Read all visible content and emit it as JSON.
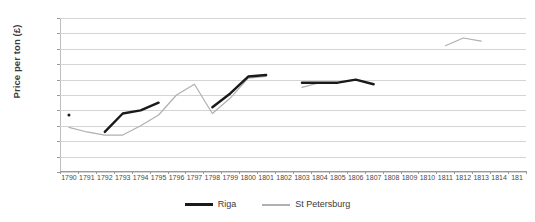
{
  "chart_data": {
    "type": "line",
    "title": "",
    "xlabel": "",
    "ylabel": "Price per ton (£)",
    "ylim": [
      0,
      100
    ],
    "ytick_step": 10,
    "yticks": [
      "0",
      "10",
      "20",
      "30",
      "40",
      "50",
      "60",
      "70",
      "80",
      "90",
      "100"
    ],
    "grid": true,
    "legend_position": "bottom",
    "categories": [
      "1790",
      "1791",
      "1792",
      "1793",
      "1794",
      "1795",
      "1796",
      "1797",
      "1798",
      "1799",
      "1800",
      "1801",
      "1802",
      "1803",
      "1804",
      "1805",
      "1806",
      "1807",
      "1808",
      "1809",
      "1810",
      "1811",
      "1812",
      "1813",
      "1814",
      "181"
    ],
    "last_tick_truncated": true,
    "series": [
      {
        "name": "Riga",
        "color": "#1a1a1a",
        "values": [
          37,
          null,
          26,
          38,
          40,
          45,
          null,
          null,
          42,
          51,
          62,
          63,
          null,
          58,
          58,
          58,
          60,
          57,
          null,
          null,
          null,
          null,
          null,
          null,
          null,
          null
        ]
      },
      {
        "name": "St Petersburg",
        "color": "#b0b0b0",
        "values": [
          29,
          26,
          24,
          24,
          30,
          37,
          50,
          57,
          38,
          48,
          61,
          62,
          null,
          55,
          58,
          58,
          60,
          57,
          null,
          null,
          null,
          82,
          87,
          85,
          null,
          null
        ]
      }
    ]
  },
  "legend": {
    "items": [
      {
        "label": "Riga",
        "swatch": "riga-line-swatch"
      },
      {
        "label": "St Petersburg",
        "swatch": "st-petersburg-line-swatch"
      }
    ]
  }
}
